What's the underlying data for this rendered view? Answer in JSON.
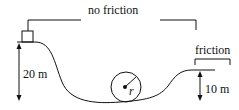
{
  "diagram": {
    "labels": {
      "no_friction": "no friction",
      "friction": "friction",
      "left_height": "20 m",
      "right_height": "10 m",
      "loop_radius": "r"
    },
    "colors": {
      "ink": "#111111",
      "background": "#ffffff"
    }
  }
}
